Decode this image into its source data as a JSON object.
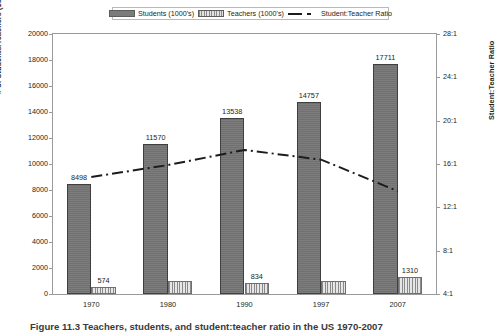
{
  "legend": {
    "items": [
      {
        "label": "Students (1000's)",
        "swatch": "students-swatch"
      },
      {
        "label": "Teachers (1000's)",
        "swatch": "teachers-swatch"
      },
      {
        "label": "Student:Teacher Ratio",
        "swatch": "ratio-line-swatch"
      }
    ]
  },
  "axes": {
    "left_title": "# of Students/Teachers (1000's)",
    "right_title": "Student:Teacher Ratio",
    "left_ticks": [
      "20000",
      "18000",
      "16000",
      "14000",
      "12000",
      "10000",
      "8000",
      "6000",
      "4000",
      "2000",
      "0"
    ],
    "right_ticks": [
      "28:1",
      "24:1",
      "20:1",
      "16:1",
      "12:1",
      "8:1",
      "4:1"
    ],
    "x_ticks": [
      "1970",
      "1980",
      "1990",
      "1997",
      "2007"
    ]
  },
  "caption": "Figure 11.3  Teachers, students, and student:teacher ratio in the US 1970-2007",
  "colors": {
    "students_bar": "#767676",
    "teachers_bar": "#cfcfcf",
    "ratio_line": "#1c1c1c",
    "frame": "#9a9a9a",
    "text": "#231f20"
  },
  "chart_data": {
    "type": "bar",
    "title": "",
    "xlabel": "",
    "ylabel": "# of Students/Teachers (1000's)",
    "y2label": "Student:Teacher Ratio",
    "categories": [
      "1970",
      "1980",
      "1990",
      "1997",
      "2007"
    ],
    "ylim": [
      0,
      20000
    ],
    "ytick_step": 2000,
    "y2lim": [
      4,
      28
    ],
    "y2tick_step": 4,
    "grid": false,
    "legend_position": "top-center",
    "series": [
      {
        "name": "Students (1000's)",
        "type": "bar",
        "axis": "left",
        "values": [
          8498,
          11570,
          13538,
          14757,
          17711
        ],
        "labels": [
          "8498",
          "11570",
          "13538",
          "14757",
          "17711"
        ]
      },
      {
        "name": "Teachers (1000's)",
        "type": "bar",
        "axis": "left",
        "values": [
          574,
          1000,
          834,
          1000,
          1310
        ],
        "labels": [
          "574",
          "",
          "834",
          "",
          "1310"
        ]
      },
      {
        "name": "Student:Teacher Ratio",
        "type": "line",
        "axis": "right",
        "values": [
          14.8,
          15.9,
          17.3,
          16.4,
          13.5
        ],
        "labels": [
          "",
          "",
          "",
          "",
          ""
        ]
      }
    ]
  }
}
